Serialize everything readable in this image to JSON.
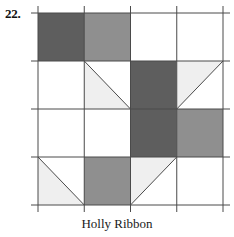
{
  "figure": {
    "number_label": "22.",
    "caption": "Holly Ribbon"
  },
  "colors": {
    "dark_gray": "#5e5e5e",
    "medium_gray": "#8f8f8f",
    "light_gray": "#efefef",
    "white": "#ffffff",
    "line": "#4a4a4a",
    "text": "#1a1a1a"
  },
  "block": {
    "name": "Holly Ribbon",
    "grid_rows": 4,
    "grid_cols": 4,
    "unit_kinds": {
      "solid": "solid square of one shade",
      "hst": "half-square triangle, two shades split by a diagonal"
    },
    "cells": [
      {
        "row": 1,
        "col": 1,
        "kind": "solid",
        "fill": "dark_gray"
      },
      {
        "row": 1,
        "col": 2,
        "kind": "solid",
        "fill": "medium_gray"
      },
      {
        "row": 1,
        "col": 3,
        "kind": "solid",
        "fill": "white"
      },
      {
        "row": 1,
        "col": 4,
        "kind": "solid",
        "fill": "white"
      },
      {
        "row": 2,
        "col": 1,
        "kind": "solid",
        "fill": "white"
      },
      {
        "row": 2,
        "col": 2,
        "kind": "hst",
        "diagonal": "tl-br",
        "upper_fill": "white",
        "lower_fill": "light_gray"
      },
      {
        "row": 2,
        "col": 3,
        "kind": "solid",
        "fill": "dark_gray"
      },
      {
        "row": 2,
        "col": 4,
        "kind": "hst",
        "diagonal": "bl-tr",
        "upper_fill": "light_gray",
        "lower_fill": "white"
      },
      {
        "row": 3,
        "col": 1,
        "kind": "solid",
        "fill": "white"
      },
      {
        "row": 3,
        "col": 2,
        "kind": "solid",
        "fill": "white"
      },
      {
        "row": 3,
        "col": 3,
        "kind": "solid",
        "fill": "dark_gray"
      },
      {
        "row": 3,
        "col": 4,
        "kind": "solid",
        "fill": "medium_gray"
      },
      {
        "row": 4,
        "col": 1,
        "kind": "hst",
        "diagonal": "tl-br",
        "upper_fill": "white",
        "lower_fill": "light_gray"
      },
      {
        "row": 4,
        "col": 2,
        "kind": "solid",
        "fill": "medium_gray"
      },
      {
        "row": 4,
        "col": 3,
        "kind": "hst",
        "diagonal": "bl-tr",
        "upper_fill": "light_gray",
        "lower_fill": "white"
      },
      {
        "row": 4,
        "col": 4,
        "kind": "solid",
        "fill": "white"
      }
    ]
  }
}
